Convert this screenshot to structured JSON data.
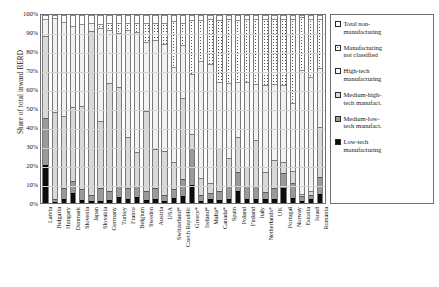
{
  "chart_data": {
    "type": "bar",
    "stacked": true,
    "title": "",
    "xlabel": "",
    "ylabel": "Share of total inward BERD",
    "ylim": [
      0,
      100
    ],
    "yticks": [
      "0%",
      "10%",
      "20%",
      "30%",
      "40%",
      "50%",
      "60%",
      "70%",
      "80%",
      "90%",
      "100%"
    ],
    "grid": true,
    "legend_position": "right",
    "categories": [
      "Latvia",
      "Bulgaria",
      "Hungary",
      "Denmark",
      "Slovenia",
      "Japan",
      "Slovakia",
      "Germany",
      "Turkey",
      "France",
      "Belgium",
      "Sweden",
      "Austria",
      "USA",
      "Switzerland*",
      "Czech Republic",
      "Greece*",
      "Ireland*",
      "Malta*",
      "Canada*",
      "Spain",
      "Poland",
      "Finland",
      "Italy",
      "Netherlands*",
      "UK",
      "Portugal",
      "Norway",
      "Estonia",
      "Israel",
      "Romania"
    ],
    "series": [
      {
        "name": "Low-tech manufacturing",
        "key": "low",
        "values": [
          20.0,
          0.5,
          2.0,
          5.5,
          1.5,
          1.0,
          1.0,
          1.5,
          3.0,
          2.0,
          3.0,
          1.5,
          2.0,
          1.0,
          2.5,
          3.5,
          9.5,
          1.0,
          2.0,
          1.5,
          2.0,
          6.5,
          2.0,
          2.0,
          2.0,
          2.0,
          8.0,
          2.5,
          1.0,
          2.0,
          5.0
        ]
      },
      {
        "name": "Medium-low-tech manufact.",
        "key": "mlow",
        "values": [
          25.0,
          1.5,
          6.0,
          6.0,
          6.0,
          3.0,
          7.0,
          5.0,
          6.0,
          6.0,
          6.0,
          5.0,
          6.0,
          3.0,
          5.0,
          9.0,
          20.0,
          3.0,
          3.5,
          5.0,
          7.0,
          10.0,
          7.0,
          7.0,
          4.0,
          6.0,
          8.0,
          8.0,
          2.5,
          2.0,
          9.0
        ]
      },
      {
        "name": "Medium-high-tech manufact.",
        "key": "mhigh",
        "values": [
          44.0,
          46.5,
          38.5,
          39.5,
          44.0,
          87.5,
          35.5,
          57.5,
          52.5,
          27.0,
          18.0,
          42.5,
          20.5,
          23.5,
          14.5,
          43.5,
          7.0,
          9.5,
          5.0,
          23.0,
          15.0,
          18.5,
          10.0,
          24.5,
          10.5,
          15.0,
          6.0,
          6.5,
          1.5,
          2.5,
          26.5
        ]
      },
      {
        "name": "High-tech manufacturing",
        "key": "high",
        "values": [
          9.0,
          50.0,
          50.0,
          43.0,
          43.5,
          4.5,
          49.5,
          28.0,
          29.0,
          57.0,
          64.0,
          36.5,
          58.0,
          57.0,
          50.5,
          28.0,
          32.0,
          62.0,
          63.5,
          35.0,
          40.0,
          29.5,
          45.5,
          30.0,
          46.5,
          40.5,
          41.0,
          36.0,
          66.0,
          60.5,
          31.5
        ]
      },
      {
        "name": "Manufacturing not classified",
        "key": "notcl",
        "values": [
          0.0,
          0.0,
          0.0,
          0.0,
          0.0,
          0.0,
          2.0,
          4.0,
          5.0,
          4.0,
          5.0,
          10.0,
          9.0,
          11.5,
          24.5,
          12.0,
          29.0,
          22.0,
          24.0,
          33.0,
          34.0,
          33.0,
          33.5,
          34.5,
          35.0,
          34.5,
          35.0,
          45.0,
          28.0,
          31.0,
          26.0
        ]
      },
      {
        "name": "Total non-manufacturing",
        "key": "nonman",
        "values": [
          2.0,
          1.5,
          3.5,
          6.0,
          5.0,
          4.0,
          5.0,
          4.0,
          4.5,
          4.0,
          4.0,
          4.5,
          4.5,
          4.0,
          3.0,
          4.0,
          2.5,
          2.5,
          2.0,
          2.5,
          2.0,
          2.5,
          2.0,
          2.0,
          2.0,
          2.0,
          2.0,
          2.0,
          1.0,
          2.0,
          2.0
        ]
      }
    ]
  },
  "legend": {
    "items": [
      {
        "label_line1": "Total non-",
        "label_line2": "manufacturing",
        "key": "nonman"
      },
      {
        "label_line1": "Manufacturing",
        "label_line2": "not classified",
        "key": "notcl"
      },
      {
        "label_line1": "High-tech",
        "label_line2": "manufacturing",
        "key": "high"
      },
      {
        "label_line1": "Medium-high-",
        "label_line2": "tech manufact.",
        "key": "mhigh"
      },
      {
        "label_line1": "Medium-low-",
        "label_line2": "tech manufact.",
        "key": "mlow"
      },
      {
        "label_line1": "Low-tech",
        "label_line2": "manufacturing",
        "key": "low"
      }
    ]
  }
}
